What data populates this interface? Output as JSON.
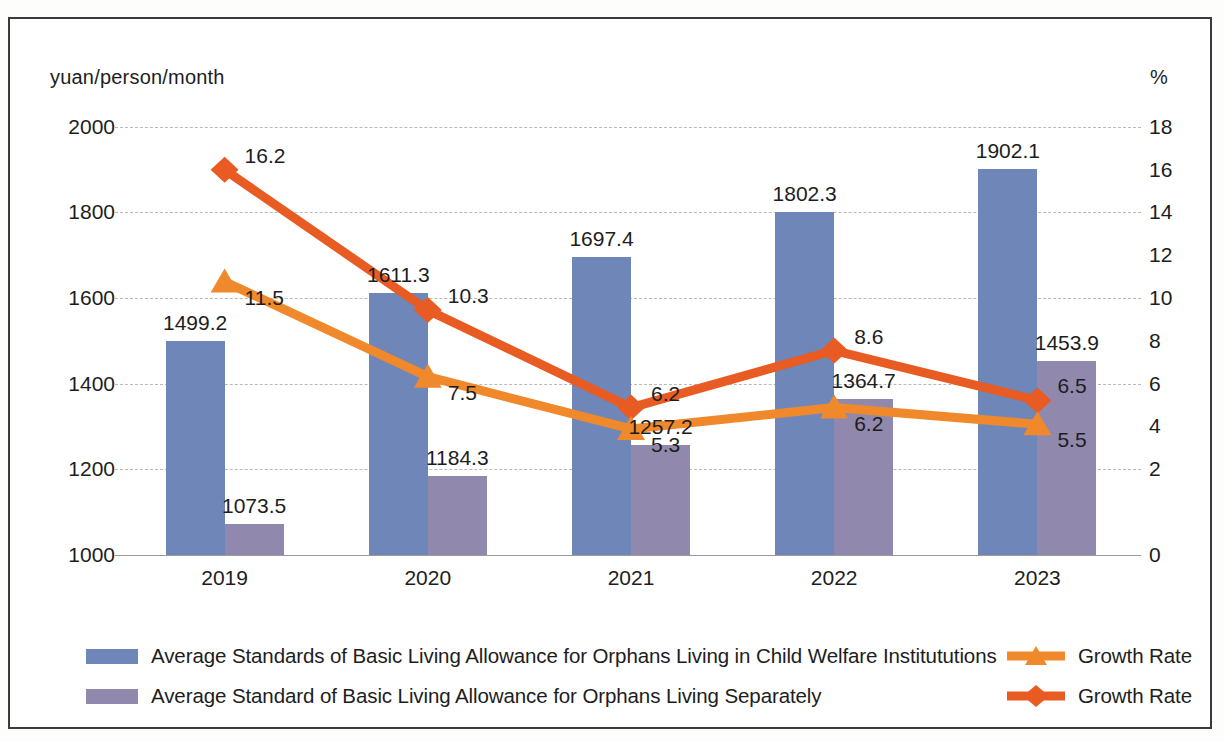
{
  "axis": {
    "left_unit": "yuan/person/month",
    "right_unit": "%",
    "left_ticks": [
      "2000",
      "1800",
      "1600",
      "1400",
      "1200",
      "1000"
    ],
    "right_ticks": [
      "18",
      "16",
      "14",
      "12",
      "10",
      "8",
      "6",
      "4",
      "2",
      "0"
    ]
  },
  "legend": {
    "items": [
      {
        "label": "Average Standards of Basic Living Allowance for Orphans Living in Child Welfare Institututions",
        "type": "swatch",
        "color": "#6f86b8"
      },
      {
        "label": "Average Standard of Basic Living Allowance for Orphans Living Separately",
        "type": "swatch",
        "color": "#9089ad"
      },
      {
        "label": "Growth Rate",
        "type": "line-triangle",
        "color": "#f0892c"
      },
      {
        "label": "Growth Rate",
        "type": "line-diamond",
        "color": "#e85b22"
      }
    ]
  },
  "chart_data": {
    "type": "bar",
    "title": "",
    "xlabel": "",
    "ylabel": "yuan/person/month",
    "y2label": "%",
    "categories": [
      "2019",
      "2020",
      "2021",
      "2022",
      "2023"
    ],
    "ylim": [
      1000,
      2000
    ],
    "y2lim": [
      0,
      18
    ],
    "grid": true,
    "legend_position": "bottom",
    "series": [
      {
        "name": "Average Standards of Basic Living Allowance for Orphans Living in Child Welfare Institututions",
        "type": "bar",
        "axis": "left",
        "color": "#6f86b8",
        "values": [
          1499.2,
          1611.3,
          1697.4,
          1802.3,
          1902.1
        ],
        "labels": [
          "1499.2",
          "1611.3",
          "1697.4",
          "1802.3",
          "1902.1"
        ]
      },
      {
        "name": "Average Standard of Basic Living Allowance for Orphans Living Separately",
        "type": "bar",
        "axis": "left",
        "color": "#9089ad",
        "values": [
          1073.5,
          1184.3,
          1257.2,
          1364.7,
          1453.9
        ],
        "labels": [
          "1073.5",
          "1184.3",
          "1257.2",
          "1364.7",
          "1453.9"
        ]
      },
      {
        "name": "Growth Rate",
        "type": "line",
        "marker": "diamond",
        "axis": "right",
        "color": "#e85b22",
        "values": [
          16.2,
          10.3,
          6.2,
          8.6,
          6.5
        ],
        "labels": [
          "16.2",
          "10.3",
          "6.2",
          "8.6",
          "6.5"
        ]
      },
      {
        "name": "Growth Rate",
        "type": "line",
        "marker": "triangle",
        "axis": "right",
        "color": "#f0892c",
        "values": [
          11.5,
          7.5,
          5.3,
          6.2,
          5.5
        ],
        "labels": [
          "11.5",
          "7.5",
          "5.3",
          "6.2",
          "5.5"
        ]
      }
    ]
  }
}
